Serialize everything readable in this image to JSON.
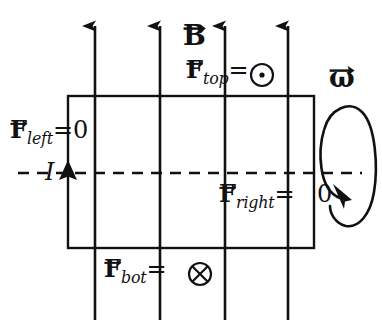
{
  "figure": {
    "background_color": "#ffffff",
    "stroke_color": "#111111"
  },
  "field": {
    "label": "B",
    "label_style": "vector-bold",
    "direction": "up",
    "line_count": 4,
    "line_x": [
      95,
      160,
      225,
      288
    ],
    "line_top_y": 24,
    "line_bottom_y": 320
  },
  "loop": {
    "name": "current-loop-rectangle",
    "left": 68,
    "top": 96,
    "right": 314,
    "bottom": 248
  },
  "current": {
    "symbol": "I",
    "arrow_direction": "up",
    "arrow_x": 68,
    "arrow_y": 173
  },
  "axis": {
    "name": "rotation-axis",
    "style": "dashed",
    "y": 173,
    "x_start": 18,
    "x_end": 362
  },
  "omega": {
    "label": "ω",
    "label_style": "vector-bold-italic",
    "rotation_arrow_direction": "counterclockwise-front"
  },
  "forces": [
    {
      "id": "f-top",
      "base": "F",
      "subscript": "top",
      "equals": "=",
      "value_symbol": "⊙",
      "value_meaning": "out-of-page",
      "text": "F_top = ⊙"
    },
    {
      "id": "f-left",
      "base": "F",
      "subscript": "left",
      "equals": "=",
      "value_symbol": "0",
      "value_meaning": "zero",
      "text": "F_left = 0"
    },
    {
      "id": "f-right",
      "base": "F",
      "subscript": "right",
      "equals": "=",
      "value_symbol": "0",
      "value_meaning": "zero",
      "text": "F_right = 0"
    },
    {
      "id": "f-bot",
      "base": "F",
      "subscript": "bot",
      "equals": "=",
      "value_symbol": "⊗",
      "value_meaning": "into-page",
      "text": "F_bot = ⊗"
    }
  ]
}
